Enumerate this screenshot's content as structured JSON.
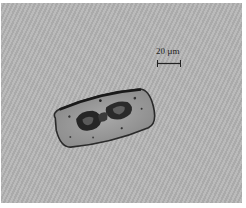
{
  "image": {
    "description": "Light micrograph of an elongated cell (diatom-like) on a gray striped background",
    "background_color": "#b3b3b3",
    "cell_fill": "#9a9a9a",
    "cell_outline": "#2a2a2a",
    "chloroplast_color": "#262626"
  },
  "scale_bar": {
    "label": "20 µm",
    "color": "#222222"
  }
}
